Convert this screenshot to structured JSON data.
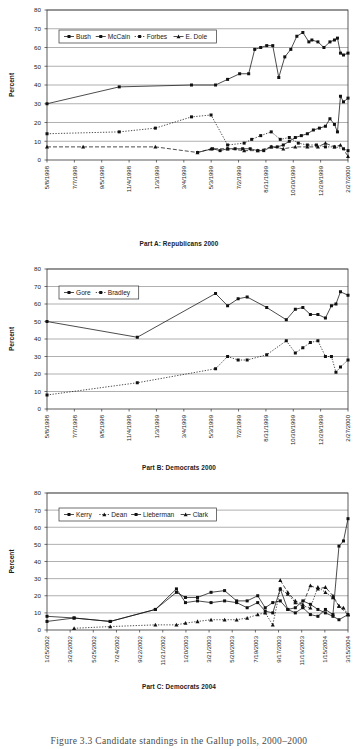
{
  "figure": {
    "caption": "Figure 3.3  Candidate standings in the Gallup polls, 2000–2000",
    "axis_title": "Percent",
    "y_ticks": [
      "0",
      "10",
      "20",
      "30",
      "40",
      "50",
      "60",
      "70",
      "80"
    ]
  },
  "panels": [
    {
      "id": "part-a",
      "caption": "Part A: Republicans 2000",
      "legend": [
        "Bush",
        "McCain",
        "Forbes",
        "E. Dole"
      ]
    },
    {
      "id": "part-b",
      "caption": "Part B: Democrats 2000",
      "legend": [
        "Gore",
        "Bradley"
      ]
    },
    {
      "id": "part-c",
      "caption": "Part C: Democrats 2004",
      "legend": [
        "Kerry",
        "Dean",
        "Lieberman",
        "Clark"
      ]
    }
  ],
  "chart_data": [
    {
      "type": "line",
      "title": "Part A: Republicans 2000",
      "xlabel": "",
      "ylabel": "Percent",
      "ylim": [
        0,
        80
      ],
      "ytick_step": 10,
      "grid": true,
      "legend_position": "top-left-inside",
      "xtick_labels": [
        "5/8/1998",
        "7/7/1998",
        "9/5/1998",
        "11/4/1998",
        "1/3/1999",
        "3/4/1999",
        "5/3/1999",
        "7/2/1999",
        "8/31/1999",
        "10/30/1999",
        "12/29/1999",
        "2/27/2000"
      ],
      "x_range": [
        "5/8/1998",
        "2/27/2000"
      ],
      "series": [
        {
          "name": "Bush",
          "style": "solid",
          "marker": "square",
          "x": [
            0.0,
            0.24,
            0.48,
            0.56,
            0.6,
            0.64,
            0.67,
            0.69,
            0.71,
            0.73,
            0.75,
            0.77,
            0.79,
            0.81,
            0.83,
            0.85,
            0.87,
            0.88,
            0.9,
            0.92,
            0.94,
            0.955,
            0.965,
            0.975,
            0.985,
            1.0
          ],
          "values": [
            30,
            39,
            40,
            40,
            43,
            46,
            46,
            59,
            60,
            61,
            61,
            44,
            55,
            59,
            66,
            68,
            63,
            64,
            63,
            60,
            63,
            64,
            65,
            57,
            56,
            57
          ]
        },
        {
          "name": "McCain",
          "style": "solid",
          "marker": "square",
          "x": [
            0.5,
            0.55,
            0.575,
            0.6,
            0.625,
            0.65,
            0.675,
            0.7,
            0.72,
            0.745,
            0.765,
            0.785,
            0.805,
            0.825,
            0.845,
            0.865,
            0.885,
            0.905,
            0.925,
            0.94,
            0.955,
            0.965,
            0.975,
            0.985,
            1.0
          ],
          "values": [
            4,
            6,
            5,
            6,
            6,
            6,
            6,
            5,
            5,
            7,
            7,
            8,
            10,
            12,
            13,
            14,
            16,
            17,
            18,
            22,
            19,
            15,
            34,
            31,
            33
          ]
        },
        {
          "name": "Forbes",
          "style": "dotted",
          "marker": "square",
          "x": [
            0.0,
            0.24,
            0.36,
            0.48,
            0.545,
            0.6,
            0.655,
            0.68,
            0.71,
            0.745,
            0.775,
            0.805,
            0.835,
            0.865,
            0.895,
            0.925,
            0.955,
            0.985,
            1.0
          ],
          "values": [
            14,
            15,
            17,
            23,
            24,
            8,
            9,
            11,
            13,
            15,
            11,
            12,
            9,
            8,
            8,
            7,
            7,
            6,
            5
          ]
        },
        {
          "name": "E. Dole",
          "style": "dashed",
          "marker": "triangle",
          "x": [
            0.0,
            0.12,
            0.36,
            0.5,
            0.545,
            0.6,
            0.655,
            0.7,
            0.745,
            0.785,
            0.825,
            0.865,
            0.9,
            0.925,
            0.955,
            0.975,
            1.0
          ],
          "values": [
            7,
            7,
            7,
            4,
            6,
            6,
            5,
            5,
            7,
            6,
            7,
            7,
            7,
            9,
            7,
            8,
            2
          ]
        }
      ]
    },
    {
      "type": "line",
      "title": "Part B: Democrats 2000",
      "xlabel": "",
      "ylabel": "Percent",
      "ylim": [
        0,
        80
      ],
      "ytick_step": 10,
      "grid": true,
      "legend_position": "top-left-inside",
      "xtick_labels": [
        "5/8/1998",
        "7/7/1998",
        "9/5/1998",
        "11/4/1998",
        "1/3/1999",
        "3/4/1999",
        "5/3/1999",
        "7/2/1999",
        "8/31/1999",
        "10/30/1999",
        "12/29/1999",
        "2/27/2000"
      ],
      "x_range": [
        "5/8/1998",
        "2/27/2000"
      ],
      "series": [
        {
          "name": "Gore",
          "style": "solid",
          "marker": "square",
          "x": [
            0.0,
            0.3,
            0.56,
            0.6,
            0.635,
            0.665,
            0.73,
            0.795,
            0.825,
            0.85,
            0.875,
            0.9,
            0.925,
            0.945,
            0.96,
            0.975,
            1.0
          ],
          "values": [
            50,
            41,
            66,
            59,
            63,
            64,
            58,
            51,
            57,
            58,
            54,
            54,
            52,
            59,
            60,
            67,
            65
          ]
        },
        {
          "name": "Bradley",
          "style": "dotted",
          "marker": "square",
          "x": [
            0.0,
            0.3,
            0.56,
            0.6,
            0.635,
            0.665,
            0.73,
            0.795,
            0.825,
            0.85,
            0.875,
            0.9,
            0.925,
            0.945,
            0.96,
            0.975,
            1.0
          ],
          "values": [
            8,
            15,
            23,
            30,
            28,
            28,
            31,
            39,
            32,
            35,
            38,
            39,
            30,
            30,
            21,
            24,
            28
          ]
        }
      ]
    },
    {
      "type": "line",
      "title": "Part C: Democrats 2004",
      "xlabel": "",
      "ylabel": "Percent",
      "ylim": [
        0,
        80
      ],
      "ytick_step": 10,
      "grid": true,
      "legend_position": "top-left-inside",
      "xtick_labels": [
        "1/25/2002",
        "3/26/2002",
        "5/25/2002",
        "7/24/2002",
        "9/22/2002",
        "11/21/2002",
        "1/20/2003",
        "3/21/2003",
        "5/20/2003",
        "7/19/2003",
        "9/17/2003",
        "11/16/2003",
        "1/15/2004",
        "3/15/2004"
      ],
      "x_range": [
        "1/25/2002",
        "3/15/2004"
      ],
      "series": [
        {
          "name": "Kerry",
          "style": "solid",
          "marker": "square",
          "x": [
            0.0,
            0.09,
            0.21,
            0.36,
            0.43,
            0.46,
            0.5,
            0.545,
            0.59,
            0.63,
            0.665,
            0.7,
            0.725,
            0.75,
            0.775,
            0.8,
            0.825,
            0.85,
            0.875,
            0.9,
            0.925,
            0.95,
            0.97,
            0.985,
            1.0
          ],
          "values": [
            5,
            7,
            5,
            12,
            24,
            16,
            17,
            16,
            17,
            16,
            13,
            16,
            11,
            10,
            24,
            12,
            10,
            13,
            9,
            8,
            12,
            9,
            49,
            52,
            65
          ]
        },
        {
          "name": "Dean",
          "style": "dotted",
          "marker": "triangle",
          "x": [
            0.09,
            0.21,
            0.36,
            0.43,
            0.46,
            0.5,
            0.545,
            0.59,
            0.63,
            0.665,
            0.7,
            0.725,
            0.75,
            0.775,
            0.8,
            0.825,
            0.85,
            0.875,
            0.9,
            0.925,
            0.95,
            0.97,
            0.985,
            1.0
          ],
          "values": [
            1,
            2,
            3,
            3,
            4,
            5,
            6,
            6,
            6,
            7,
            9,
            10,
            3,
            24,
            21,
            16,
            14,
            13,
            25,
            22,
            19,
            14,
            13,
            9
          ]
        },
        {
          "name": "Lieberman",
          "style": "solid",
          "marker": "square",
          "x": [
            0.0,
            0.09,
            0.21,
            0.36,
            0.43,
            0.46,
            0.5,
            0.545,
            0.59,
            0.63,
            0.665,
            0.7,
            0.725,
            0.75,
            0.775,
            0.8,
            0.825,
            0.85,
            0.875,
            0.9,
            0.925,
            0.95,
            0.97,
            1.0
          ],
          "values": [
            8,
            7,
            5,
            12,
            22,
            19,
            19,
            22,
            23,
            17,
            17,
            20,
            13,
            16,
            17,
            12,
            13,
            17,
            15,
            12,
            10,
            8,
            6,
            9
          ]
        },
        {
          "name": "Clark",
          "style": "dashed",
          "marker": "triangle",
          "x": [
            0.775,
            0.8,
            0.825,
            0.85,
            0.875,
            0.9,
            0.925,
            0.95,
            0.97,
            1.0
          ],
          "values": [
            29,
            22,
            17,
            15,
            26,
            24,
            25,
            20,
            14,
            9
          ]
        }
      ]
    }
  ]
}
